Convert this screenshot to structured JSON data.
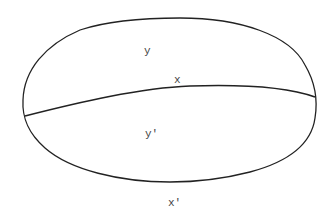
{
  "diagram": {
    "shape": "ellipse divided by curved chord",
    "labels": {
      "upper_region": "y",
      "chord": "x",
      "lower_region": "y'",
      "below_ellipse": "x'"
    },
    "colors": {
      "stroke": "#222222",
      "text": "#444444",
      "background": "#ffffff"
    }
  }
}
